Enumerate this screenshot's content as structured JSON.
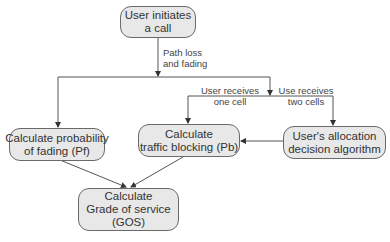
{
  "diagram": {
    "nodes": {
      "start": {
        "line1": "User initiates",
        "line2": "a call"
      },
      "fading": {
        "line1": "Calculate probability",
        "line2": "of fading  (Pf)"
      },
      "blocking": {
        "line1": "Calculate",
        "line2": "traffic blocking (Pb)"
      },
      "allocation": {
        "line1": "User's allocation",
        "line2": "decision algorithm"
      },
      "gos": {
        "line1": "Calculate",
        "line2": "Grade of service",
        "line3": "(GOS)"
      }
    },
    "edge_labels": {
      "path_loss": {
        "line1": "Path loss",
        "line2": "and fading"
      },
      "one_cell": {
        "line1": "User receives",
        "line2": "one cell"
      },
      "two_cells": {
        "line1": "Use  receives",
        "line2": "two cells"
      }
    },
    "colors": {
      "node_fill": "#e8e8e8",
      "node_border": "#6a6a6a",
      "line": "#555555",
      "text": "#333333"
    }
  }
}
